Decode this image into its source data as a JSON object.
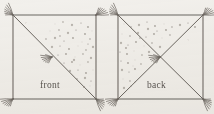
{
  "figure": {
    "background_color": "#f2f0ec",
    "ink_color": "#6b6660",
    "stipple_color": "#8a847c",
    "label_color": "#5a5550"
  },
  "panels": [
    {
      "id": "front",
      "label": "front",
      "label_x": 40,
      "label_y": 88,
      "frame": {
        "x": 13,
        "y": 15,
        "width": 83,
        "height": 84
      },
      "diagonals": [
        "top-left-to-bottom-right"
      ],
      "stipple_region": "upper-right-triangle",
      "stipple_count": 44,
      "center_tassel": true,
      "corner_tassels": [
        "top-left",
        "top-right",
        "bottom-left",
        "bottom-right"
      ]
    },
    {
      "id": "back",
      "label": "back",
      "label_x": 147,
      "label_y": 88,
      "frame": {
        "x": 118,
        "y": 15,
        "width": 85,
        "height": 84
      },
      "diagonals": [
        "top-left-to-bottom-right",
        "top-right-to-bottom-left"
      ],
      "stipple_region": "left-triangle",
      "stipple_count": 46,
      "center_tassel": true,
      "corner_tassels": [
        "top-left",
        "top-right",
        "bottom-left",
        "bottom-right"
      ]
    }
  ],
  "stipples": {
    "front": [
      [
        55,
        24
      ],
      [
        63,
        22
      ],
      [
        72,
        25
      ],
      [
        81,
        23
      ],
      [
        88,
        27
      ],
      [
        50,
        31
      ],
      [
        59,
        30
      ],
      [
        68,
        33
      ],
      [
        76,
        30
      ],
      [
        85,
        34
      ],
      [
        92,
        31
      ],
      [
        46,
        39
      ],
      [
        55,
        38
      ],
      [
        64,
        41
      ],
      [
        73,
        38
      ],
      [
        82,
        42
      ],
      [
        90,
        39
      ],
      [
        52,
        47
      ],
      [
        60,
        46
      ],
      [
        69,
        49
      ],
      [
        78,
        46
      ],
      [
        86,
        50
      ],
      [
        93,
        47
      ],
      [
        58,
        55
      ],
      [
        66,
        54
      ],
      [
        75,
        57
      ],
      [
        83,
        54
      ],
      [
        91,
        58
      ],
      [
        64,
        63
      ],
      [
        72,
        62
      ],
      [
        80,
        65
      ],
      [
        88,
        62
      ],
      [
        70,
        71
      ],
      [
        78,
        70
      ],
      [
        86,
        73
      ],
      [
        93,
        70
      ],
      [
        77,
        79
      ],
      [
        85,
        78
      ],
      [
        91,
        81
      ],
      [
        84,
        87
      ],
      [
        90,
        86
      ],
      [
        60,
        36
      ],
      [
        74,
        60
      ],
      [
        88,
        44
      ]
    ],
    "back": [
      [
        124,
        24
      ],
      [
        131,
        27
      ],
      [
        139,
        25
      ],
      [
        147,
        22
      ],
      [
        155,
        26
      ],
      [
        164,
        24
      ],
      [
        172,
        27
      ],
      [
        180,
        25
      ],
      [
        188,
        23
      ],
      [
        195,
        27
      ],
      [
        122,
        34
      ],
      [
        130,
        36
      ],
      [
        138,
        33
      ],
      [
        146,
        37
      ],
      [
        154,
        34
      ],
      [
        162,
        38
      ],
      [
        170,
        35
      ],
      [
        121,
        43
      ],
      [
        128,
        45
      ],
      [
        136,
        42
      ],
      [
        144,
        46
      ],
      [
        152,
        43
      ],
      [
        160,
        47
      ],
      [
        120,
        52
      ],
      [
        127,
        54
      ],
      [
        134,
        51
      ],
      [
        142,
        55
      ],
      [
        149,
        52
      ],
      [
        121,
        61
      ],
      [
        128,
        63
      ],
      [
        135,
        60
      ],
      [
        141,
        64
      ],
      [
        122,
        70
      ],
      [
        129,
        72
      ],
      [
        135,
        69
      ],
      [
        123,
        79
      ],
      [
        130,
        81
      ],
      [
        124,
        88
      ],
      [
        131,
        86
      ],
      [
        126,
        48
      ],
      [
        133,
        66
      ],
      [
        140,
        38
      ],
      [
        148,
        29
      ],
      [
        157,
        31
      ],
      [
        166,
        30
      ]
    ]
  },
  "tassels": {
    "front_corners": [
      {
        "x": 13,
        "y": 15,
        "angle": 215
      },
      {
        "x": 96,
        "y": 15,
        "angle": 325
      },
      {
        "x": 13,
        "y": 99,
        "angle": 145
      },
      {
        "x": 96,
        "y": 99,
        "angle": 35
      }
    ],
    "front_center": {
      "x": 52,
      "y": 57,
      "angle": 160
    },
    "back_corners": [
      {
        "x": 118,
        "y": 15,
        "angle": 215
      },
      {
        "x": 203,
        "y": 15,
        "angle": 325
      },
      {
        "x": 118,
        "y": 99,
        "angle": 145
      },
      {
        "x": 203,
        "y": 99,
        "angle": 35
      }
    ],
    "back_center": {
      "x": 160,
      "y": 57,
      "angle": 160
    }
  }
}
